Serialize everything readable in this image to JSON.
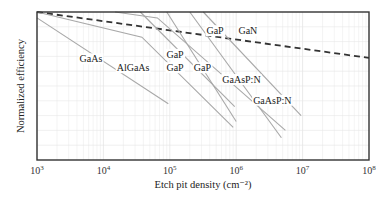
{
  "chart_data": {
    "type": "line",
    "title": "",
    "xlabel": "Etch pit density (cm⁻²)",
    "ylabel": "Normalized efficiency",
    "xscale": "log",
    "xlim": [
      1000,
      100000000
    ],
    "ylim": [
      0,
      1
    ],
    "grid": true,
    "legend": "inline labels",
    "x_ticks": [
      {
        "base": "10",
        "exp": "3"
      },
      {
        "base": "10",
        "exp": "4"
      },
      {
        "base": "10",
        "exp": "5"
      },
      {
        "base": "10",
        "exp": "6"
      },
      {
        "base": "10",
        "exp": "7"
      },
      {
        "base": "10",
        "exp": "8"
      }
    ],
    "series": [
      {
        "name": "GaN",
        "style": "dashed",
        "points": [
          [
            1000,
            1.0
          ],
          [
            100000000,
            0.69
          ]
        ]
      },
      {
        "name": "GaAs",
        "style": "solid",
        "points": [
          [
            1000,
            0.96
          ],
          [
            95000,
            0.38
          ]
        ]
      },
      {
        "name": "AlGaAs",
        "style": "solid",
        "points": [
          [
            1000,
            1.0
          ],
          [
            38000,
            0.83
          ],
          [
            900000,
            0.22
          ]
        ]
      },
      {
        "name": "GaP",
        "style": "solid",
        "points": [
          [
            36000,
            1.0
          ],
          [
            950000,
            0.36
          ]
        ]
      },
      {
        "name": "GaP",
        "style": "solid",
        "points": [
          [
            90000,
            1.0
          ],
          [
            1000000,
            0.26
          ]
        ]
      },
      {
        "name": "GaP",
        "style": "solid",
        "points": [
          [
            15000,
            1.0
          ],
          [
            65000,
            0.96
          ],
          [
            5500000,
            0.2
          ]
        ]
      },
      {
        "name": "GaAsP:N",
        "style": "solid",
        "points": [
          [
            200000,
            1.0
          ],
          [
            4800000,
            0.15
          ]
        ]
      },
      {
        "name": "GaAsP:N",
        "style": "solid",
        "points": [
          [
            320000,
            1.0
          ],
          [
            9500000,
            0.3
          ]
        ]
      }
    ],
    "annotations": [
      {
        "text": "GaN",
        "x": 1500000,
        "y": 0.85
      },
      {
        "text": "GaAs",
        "x": 6500,
        "y": 0.66
      },
      {
        "text": "AlGaAs",
        "x": 28000,
        "y": 0.6
      },
      {
        "text": "GaP",
        "x": 120000,
        "y": 0.69
      },
      {
        "text": "GaP",
        "x": 120000,
        "y": 0.6
      },
      {
        "text": "GaP",
        "x": 310000,
        "y": 0.6
      },
      {
        "text": "GaP",
        "x": 480000,
        "y": 0.85
      },
      {
        "text": "GaAsP:N",
        "x": 1200000,
        "y": 0.52
      },
      {
        "text": "GaAsP:N",
        "x": 3500000,
        "y": 0.38
      }
    ]
  }
}
